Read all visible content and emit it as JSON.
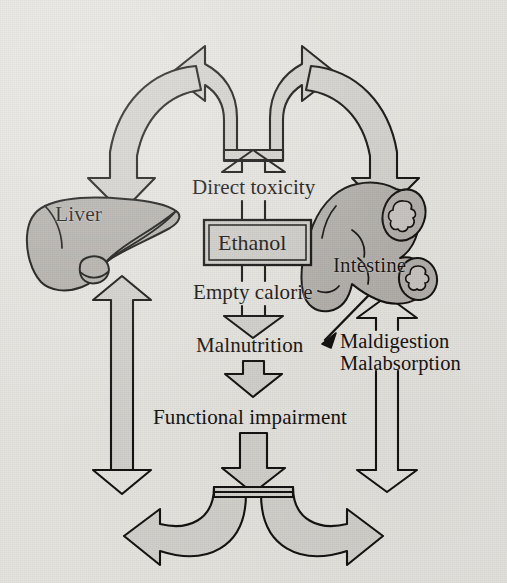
{
  "figure": {
    "type": "medical-flow-diagram",
    "title_visible": false,
    "background_color": "#e6e4df",
    "ink_color": "#161412",
    "arrow_fill_color": "#d2d0cb",
    "organ_fill_color": "#b3b0ab",
    "box_fill_color": "#cfcdc8"
  },
  "nodes": {
    "ethanol": "Ethanol",
    "liver": "Liver",
    "intestine": "Intestine",
    "direct_toxicity": "Direct toxicity",
    "empty_calorie": "Empty calorie",
    "malnutrition": "Malnutrition",
    "functional_impairment": "Functional impairment",
    "maldigestion": "Maldigestion",
    "malabsorption": "Malabsorption"
  },
  "edges": [
    {
      "from": "Ethanol",
      "to": "Direct toxicity",
      "style": "open-up-arrow",
      "label": ""
    },
    {
      "from": "Direct toxicity",
      "to": "Liver",
      "style": "branching-curved-arrow-left",
      "label": ""
    },
    {
      "from": "Direct toxicity",
      "to": "Intestine",
      "style": "branching-curved-arrow-right",
      "label": ""
    },
    {
      "from": "Ethanol",
      "to": "Empty calorie",
      "style": "open-down-arrow",
      "label": ""
    },
    {
      "from": "Empty calorie",
      "to": "Malnutrition",
      "style": "open-down-arrow",
      "label": ""
    },
    {
      "from": "Malnutrition",
      "to": "Functional impairment",
      "style": "open-down-arrow",
      "label": ""
    },
    {
      "from": "Functional impairment",
      "to": "Liver",
      "style": "curved-return-arrow-left",
      "label": ""
    },
    {
      "from": "Functional impairment",
      "to": "Intestine",
      "style": "curved-return-arrow-right",
      "label": ""
    },
    {
      "from": "Intestine",
      "to": "Maldigestion / Malabsorption",
      "style": "open-up-arrow-shaft",
      "label": ""
    },
    {
      "from": "Maldigestion / Malabsorption",
      "to": "Malnutrition",
      "style": "thin-diagonal-arrow",
      "label": ""
    }
  ],
  "organs": [
    {
      "name": "Liver",
      "shape": "liver-with-gallbladder"
    },
    {
      "name": "Intestine",
      "shape": "curved-intestine-with-two-cross-sections"
    }
  ]
}
